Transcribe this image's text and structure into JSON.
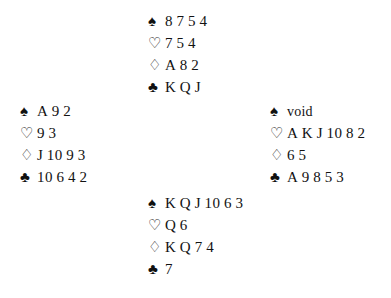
{
  "diagram": {
    "type": "bridge-deal",
    "suit_symbols": {
      "spades": "♠",
      "hearts": "♡",
      "diamonds": "♢",
      "clubs": "♣"
    },
    "hands": {
      "north": {
        "position": "North",
        "suits": [
          {
            "suit": "spades",
            "symbol": "♠",
            "fill": "solid",
            "cards": [
              "8",
              "7",
              "5",
              "4"
            ]
          },
          {
            "suit": "hearts",
            "symbol": "♡",
            "fill": "hollow",
            "cards": [
              "7",
              "5",
              "4"
            ]
          },
          {
            "suit": "diamonds",
            "symbol": "♢",
            "fill": "hollow",
            "cards": [
              "A",
              "8",
              "2"
            ]
          },
          {
            "suit": "clubs",
            "symbol": "♣",
            "fill": "solid",
            "cards": [
              "K",
              "Q",
              "J"
            ]
          }
        ]
      },
      "west": {
        "position": "West",
        "suits": [
          {
            "suit": "spades",
            "symbol": "♠",
            "fill": "solid",
            "cards": [
              "A",
              "9",
              "2"
            ]
          },
          {
            "suit": "hearts",
            "symbol": "♡",
            "fill": "hollow",
            "cards": [
              "9",
              "3"
            ]
          },
          {
            "suit": "diamonds",
            "symbol": "♢",
            "fill": "hollow",
            "cards": [
              "J",
              "10",
              "9",
              "3"
            ]
          },
          {
            "suit": "clubs",
            "symbol": "♣",
            "fill": "solid",
            "cards": [
              "10",
              "6",
              "4",
              "2"
            ]
          }
        ]
      },
      "east": {
        "position": "East",
        "suits": [
          {
            "suit": "spades",
            "symbol": "♠",
            "fill": "solid",
            "cards": [],
            "void_label": "void"
          },
          {
            "suit": "hearts",
            "symbol": "♡",
            "fill": "hollow",
            "cards": [
              "A",
              "K",
              "J",
              "10",
              "8",
              "2"
            ]
          },
          {
            "suit": "diamonds",
            "symbol": "♢",
            "fill": "hollow",
            "cards": [
              "6",
              "5"
            ]
          },
          {
            "suit": "clubs",
            "symbol": "♣",
            "fill": "solid",
            "cards": [
              "A",
              "9",
              "8",
              "5",
              "3"
            ]
          }
        ]
      },
      "south": {
        "position": "South",
        "suits": [
          {
            "suit": "spades",
            "symbol": "♠",
            "fill": "solid",
            "cards": [
              "K",
              "Q",
              "J",
              "10",
              "6",
              "3"
            ]
          },
          {
            "suit": "hearts",
            "symbol": "♡",
            "fill": "hollow",
            "cards": [
              "Q",
              "6"
            ]
          },
          {
            "suit": "diamonds",
            "symbol": "♢",
            "fill": "hollow",
            "cards": [
              "K",
              "Q",
              "7",
              "4"
            ]
          },
          {
            "suit": "clubs",
            "symbol": "♣",
            "fill": "solid",
            "cards": [
              "7"
            ]
          }
        ]
      }
    }
  }
}
